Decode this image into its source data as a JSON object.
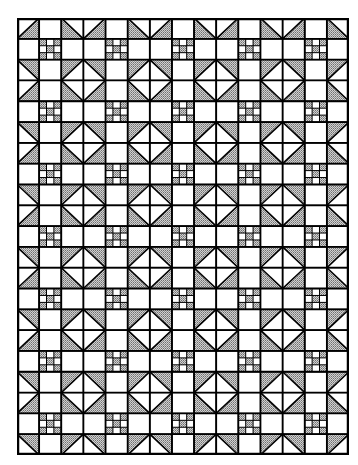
{
  "quilt": {
    "pattern": "shoo-fly-nine-patch",
    "block_columns": 5,
    "block_rows": 7,
    "cells_per_block": 3,
    "width": 332,
    "height": 437,
    "colors": {
      "background": "#ffffff",
      "shade": "#a8a8a8",
      "line": "#000000"
    },
    "block_layout": [
      [
        "hst-tl",
        "plain",
        "hst-tr"
      ],
      [
        "plain",
        "nine-patch",
        "plain"
      ],
      [
        "hst-bl",
        "plain",
        "hst-br"
      ]
    ],
    "nine_patch_shaded": [
      [
        1,
        0,
        1
      ],
      [
        0,
        1,
        0
      ],
      [
        1,
        0,
        1
      ]
    ]
  }
}
